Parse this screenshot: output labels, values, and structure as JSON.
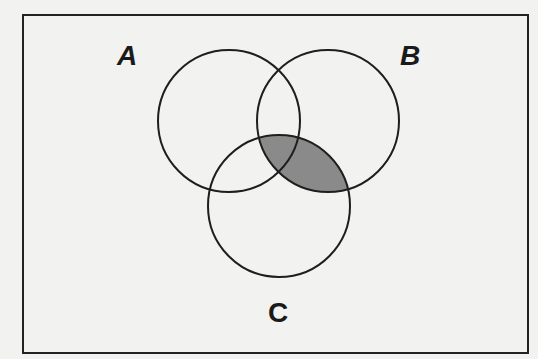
{
  "diagram": {
    "type": "venn",
    "frame": {
      "x": 23,
      "y": 15,
      "width": 505,
      "height": 338,
      "stroke": "#222222"
    },
    "background": "#f2f2f0",
    "line_color": "#1e1e1e",
    "shade_color": "#8a8a8a",
    "sets": [
      {
        "id": "A",
        "label": "A",
        "cx": 229,
        "cy": 121,
        "r": 71,
        "label_x": 117,
        "label_y": 42,
        "italic": true
      },
      {
        "id": "B",
        "label": "B",
        "cx": 328,
        "cy": 121,
        "r": 71,
        "label_x": 400,
        "label_y": 42,
        "italic": true
      },
      {
        "id": "C",
        "label": "C",
        "cx": 279,
        "cy": 206,
        "r": 71,
        "label_x": 268,
        "label_y": 299,
        "italic": false
      }
    ],
    "shaded_region": "B ∩ C"
  }
}
